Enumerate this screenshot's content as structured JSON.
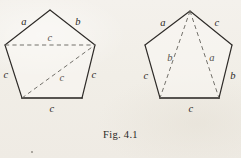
{
  "figure": {
    "caption": "Fig. 4.1",
    "background_color": "#f2efe9",
    "ink_color": "#2e2b28",
    "dashed_color": "#6d6a64",
    "left_pentagon": {
      "name": "pentagon-with-two-diagonals",
      "vertices": [
        {
          "name": "apex",
          "x": 50,
          "y": 10
        },
        {
          "name": "upper-right",
          "x": 95,
          "y": 45
        },
        {
          "name": "lower-right",
          "x": 82,
          "y": 98
        },
        {
          "name": "lower-left",
          "x": 22,
          "y": 98
        },
        {
          "name": "upper-left",
          "x": 5,
          "y": 45
        }
      ],
      "side_labels": [
        {
          "name": "side-upper-left",
          "text": "a",
          "x": 24,
          "y": 22
        },
        {
          "name": "side-upper-right",
          "text": "b",
          "x": 78,
          "y": 22
        },
        {
          "name": "side-left",
          "text": "c",
          "x": 6,
          "y": 75
        },
        {
          "name": "side-right",
          "text": "c",
          "x": 94,
          "y": 75
        },
        {
          "name": "side-bottom",
          "text": "c",
          "x": 52,
          "y": 109
        }
      ],
      "diagonals": [
        {
          "name": "diagonal-horizontal",
          "from": "upper-left",
          "to": "upper-right",
          "x1": 5,
          "y1": 45,
          "x2": 95,
          "y2": 45,
          "label": {
            "text": "c",
            "x": 50,
            "y": 38
          }
        },
        {
          "name": "diagonal-lower-left-to-upper-right",
          "from": "lower-left",
          "to": "upper-right",
          "x1": 22,
          "y1": 98,
          "x2": 95,
          "y2": 45,
          "label": {
            "text": "c",
            "x": 62,
            "y": 78
          }
        }
      ]
    },
    "right_pentagon": {
      "name": "pentagon-with-two-apex-diagonals",
      "vertices": [
        {
          "name": "apex",
          "x": 190,
          "y": 11
        },
        {
          "name": "upper-right",
          "x": 232,
          "y": 45
        },
        {
          "name": "lower-right",
          "x": 219,
          "y": 98
        },
        {
          "name": "lower-left",
          "x": 160,
          "y": 98
        },
        {
          "name": "upper-left",
          "x": 145,
          "y": 45
        }
      ],
      "side_labels": [
        {
          "name": "side-upper-left",
          "text": "a",
          "x": 163,
          "y": 23
        },
        {
          "name": "side-upper-right",
          "text": "c",
          "x": 217,
          "y": 23
        },
        {
          "name": "side-left",
          "text": "c",
          "x": 146,
          "y": 76
        },
        {
          "name": "side-right",
          "text": "b",
          "x": 233,
          "y": 76
        },
        {
          "name": "side-bottom",
          "text": "c",
          "x": 191,
          "y": 109
        }
      ],
      "diagonals": [
        {
          "name": "diagonal-apex-to-lower-left",
          "from": "apex",
          "to": "lower-left",
          "x1": 190,
          "y1": 11,
          "x2": 160,
          "y2": 98,
          "label": {
            "text": "b",
            "x": 170,
            "y": 58
          }
        },
        {
          "name": "diagonal-apex-to-lower-right",
          "from": "apex",
          "to": "lower-right",
          "x1": 190,
          "y1": 11,
          "x2": 219,
          "y2": 98,
          "label": {
            "text": "a",
            "x": 212,
            "y": 58
          }
        }
      ]
    }
  }
}
